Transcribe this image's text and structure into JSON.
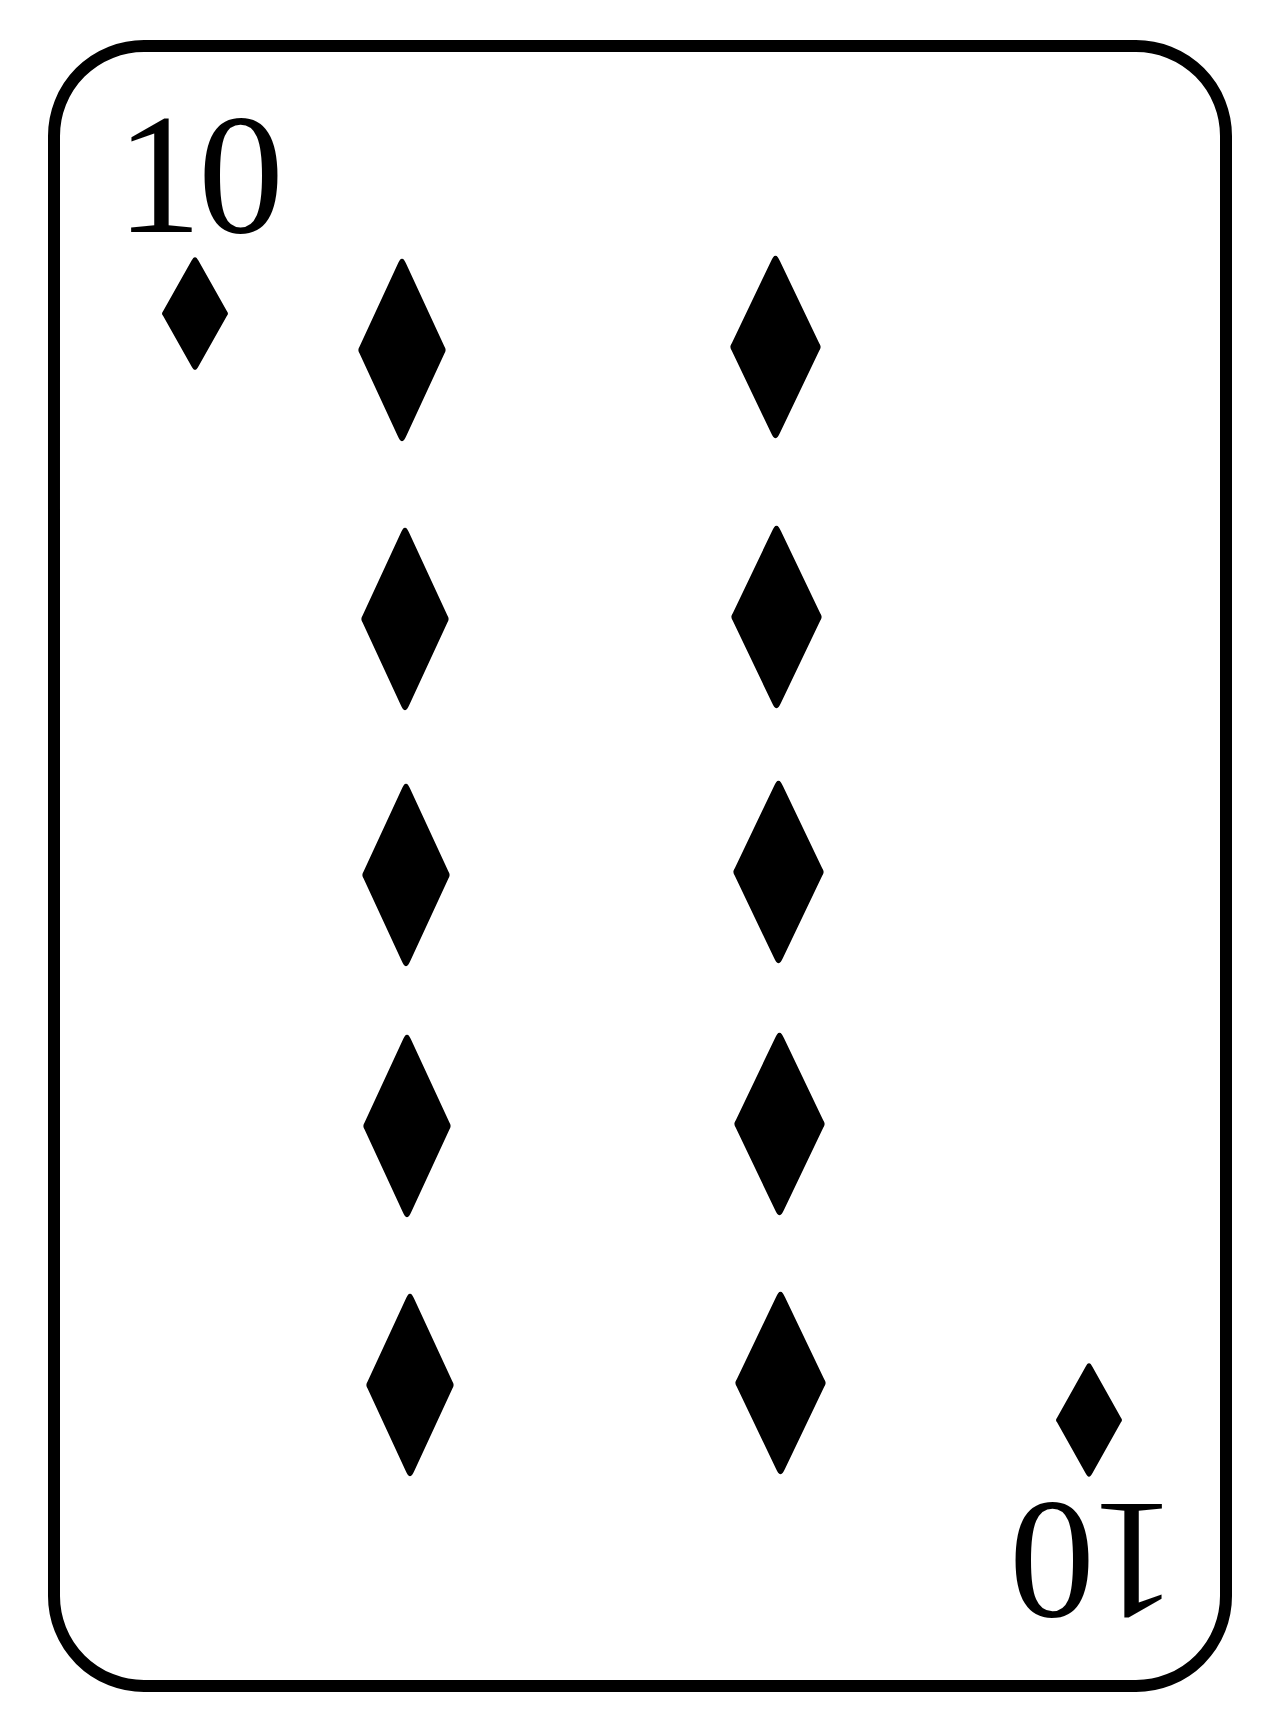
{
  "card": {
    "rank": "10",
    "suit": "diamonds",
    "suit_icon": "diamond-icon",
    "background_color": "#ffffff",
    "ink_color": "#000000",
    "border": {
      "color": "#000000",
      "stroke_width": 12,
      "x": 54,
      "y": 46,
      "width": 1172,
      "height": 1640,
      "corner_radius": 90
    },
    "corner_index_top": {
      "label": "10",
      "pip": {
        "cx": 195,
        "cy": 313,
        "w": 68,
        "h": 115
      }
    },
    "corner_index_bottom": {
      "label": "10",
      "rotated": true,
      "pip": {
        "cx": 1089,
        "cy": 1420,
        "w": 68,
        "h": 116
      }
    },
    "pips": [
      {
        "column": "left",
        "row": 1,
        "cx": 402,
        "cy": 350,
        "w": 90,
        "h": 186
      },
      {
        "column": "left",
        "row": 2,
        "cx": 405,
        "cy": 619,
        "w": 90,
        "h": 186
      },
      {
        "column": "left",
        "row": 3,
        "cx": 406,
        "cy": 875,
        "w": 90,
        "h": 186
      },
      {
        "column": "left",
        "row": 4,
        "cx": 407,
        "cy": 1126,
        "w": 90,
        "h": 186
      },
      {
        "column": "left",
        "row": 5,
        "cx": 410,
        "cy": 1385,
        "w": 90,
        "h": 186
      },
      {
        "column": "right",
        "row": 1,
        "cx": 775,
        "cy": 347,
        "w": 93,
        "h": 186
      },
      {
        "column": "right",
        "row": 2,
        "cx": 776,
        "cy": 617,
        "w": 93,
        "h": 186
      },
      {
        "column": "right",
        "row": 3,
        "cx": 778,
        "cy": 872,
        "w": 93,
        "h": 186
      },
      {
        "column": "right",
        "row": 4,
        "cx": 779,
        "cy": 1124,
        "w": 93,
        "h": 186
      },
      {
        "column": "right",
        "row": 5,
        "cx": 780,
        "cy": 1383,
        "w": 93,
        "h": 186
      }
    ]
  }
}
